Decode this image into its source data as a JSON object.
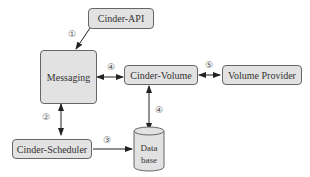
{
  "nodes": {
    "cinder_api": "Cinder-API",
    "messaging": "Messaging",
    "cinder_volume": "Cinder-Volume",
    "volume_provider": "Volume Provider",
    "cinder_scheduler": "Cinder-Scheduler",
    "database_line1": "Data",
    "database_line2": "base"
  },
  "step_labels": {
    "s1": "①",
    "s2": "②",
    "s3": "③",
    "s4a": "④",
    "s4b": "④",
    "s5": "⑤"
  },
  "edges": [
    {
      "from": "Cinder-API",
      "to": "Messaging",
      "label": "①",
      "direction": "one-way"
    },
    {
      "from": "Messaging",
      "to": "Cinder-Scheduler",
      "label": "②",
      "direction": "two-way"
    },
    {
      "from": "Cinder-Scheduler",
      "to": "Database",
      "label": "③",
      "direction": "one-way"
    },
    {
      "from": "Messaging",
      "to": "Cinder-Volume",
      "label": "④",
      "direction": "two-way"
    },
    {
      "from": "Cinder-Volume",
      "to": "Database",
      "label": "④",
      "direction": "two-way"
    },
    {
      "from": "Cinder-Volume",
      "to": "Volume Provider",
      "label": "⑤",
      "direction": "two-way"
    }
  ]
}
